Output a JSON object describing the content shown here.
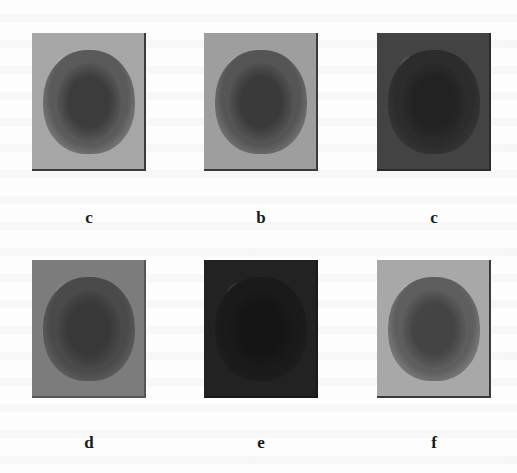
{
  "figure": {
    "panels": [
      {
        "id": "p1",
        "label": "c",
        "x": 32,
        "y": 33,
        "bg": "#a6a6a6",
        "brain": "#5a5a5a",
        "core": "#3c3c3c",
        "edge": "#3a3a3a"
      },
      {
        "id": "p2",
        "label": "b",
        "x": 204,
        "y": 33,
        "bg": "#9e9e9e",
        "brain": "#555555",
        "core": "#3a3a3a",
        "edge": "#3a3a3a"
      },
      {
        "id": "p3",
        "label": "c",
        "x": 377,
        "y": 33,
        "bg": "#434343",
        "brain": "#2c2c2c",
        "core": "#222222",
        "edge": "#2a2a2a"
      },
      {
        "id": "p4",
        "label": "d",
        "x": 32,
        "y": 260,
        "bg": "#7c7c7c",
        "brain": "#4a4a4a",
        "core": "#383838",
        "edge": "#555555"
      },
      {
        "id": "p5",
        "label": "e",
        "x": 204,
        "y": 260,
        "bg": "#222222",
        "brain": "#1a1a1a",
        "core": "#151515",
        "edge": "#1a1a1a"
      },
      {
        "id": "p6",
        "label": "f",
        "x": 377,
        "y": 260,
        "bg": "#a8a8a8",
        "brain": "#5e5e5e",
        "core": "#444444",
        "edge": "#3a3a3a"
      }
    ],
    "label_rows_y": [
      209,
      434
    ]
  }
}
